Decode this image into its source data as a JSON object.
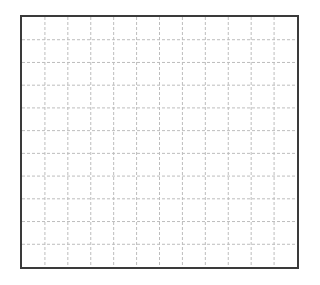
{
  "chart_data": {
    "type": "line",
    "title": "",
    "xlabel": "",
    "ylabel": "",
    "series": [],
    "grid": true,
    "grid_style": "dashed",
    "grid_columns": 12,
    "grid_rows": 11,
    "legend": null,
    "x_ticks": [],
    "y_ticks": []
  },
  "colors": {
    "border": "#3a3a3a",
    "grid": "#bdbdbd",
    "background": "#ffffff"
  }
}
